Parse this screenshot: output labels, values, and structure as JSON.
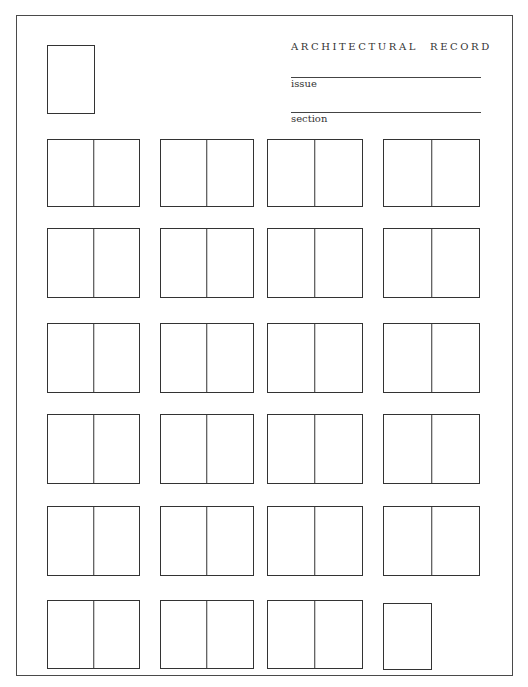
{
  "header": {
    "publication_word1": "ARCHITECTURAL",
    "publication_word2": "RECORD",
    "issue_label": "issue",
    "issue_value": "",
    "section_label": "section",
    "section_value": ""
  },
  "layout": {
    "cover": {
      "x": 47,
      "y": 45,
      "w": 48,
      "h": 69
    },
    "columns": [
      {
        "x": 47,
        "w": 93
      },
      {
        "x": 160,
        "w": 94
      },
      {
        "x": 267,
        "w": 96
      },
      {
        "x": 383,
        "w": 97
      }
    ],
    "rows": [
      {
        "y": 139,
        "h": 68
      },
      {
        "y": 228,
        "h": 70
      },
      {
        "y": 323,
        "h": 70
      },
      {
        "y": 414,
        "h": 70
      },
      {
        "y": 506,
        "h": 70
      },
      {
        "y": 600,
        "h": 69
      }
    ],
    "last_single_page": {
      "x": 383,
      "y": 603,
      "w": 49,
      "h": 67
    }
  },
  "grid": {
    "spread_count": 23,
    "single_page_count": 1,
    "cover_count": 1
  },
  "colors": {
    "line": "#333333",
    "paper": "#ffffff"
  }
}
